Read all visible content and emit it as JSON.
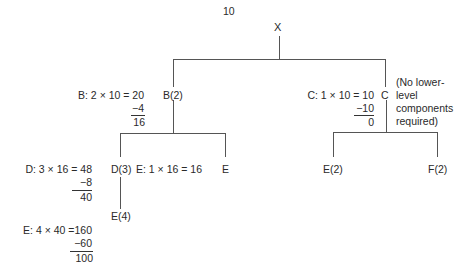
{
  "top_quantity": "10",
  "root": {
    "label": "X"
  },
  "level1": {
    "B": {
      "node_label": "B(2)",
      "calc": {
        "line1": "B: 2 × 10 = 20",
        "subtract": "−4",
        "result": "16"
      }
    },
    "C": {
      "node_label": "C",
      "calc": {
        "line1": "C: 1 × 10 = 10",
        "subtract": "−10",
        "result": "0"
      },
      "note": [
        "(No lower-",
        "level",
        "components",
        "required)"
      ]
    }
  },
  "level2": {
    "D": {
      "node_label": "D(3)",
      "calc": {
        "line1": "D: 3 × 16 = 48",
        "subtract": "−8",
        "result": "40"
      }
    },
    "E_under_B": {
      "node_label": "E",
      "calc": {
        "line1": "E: 1 × 16 = 16"
      }
    },
    "E_under_C": {
      "node_label": "E(2)"
    },
    "F_under_C": {
      "node_label": "F(2)"
    }
  },
  "level3": {
    "E_under_D": {
      "node_label": "E(4)",
      "calc": {
        "line1": "E: 4 × 40 =160",
        "subtract": "−60",
        "result": "100"
      }
    }
  }
}
